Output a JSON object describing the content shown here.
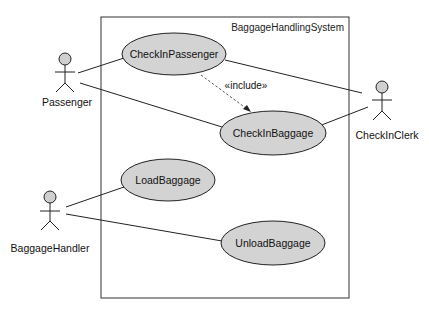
{
  "diagram": {
    "type": "uml-use-case",
    "system": {
      "label": "BaggageHandlingSystem"
    },
    "actors": [
      {
        "id": "passenger",
        "label": "Passenger"
      },
      {
        "id": "checkinclerk",
        "label": "CheckInClerk"
      },
      {
        "id": "baggagehandler",
        "label": "BaggageHandler"
      }
    ],
    "use_cases": [
      {
        "id": "checkinpassenger",
        "label": "CheckInPassenger"
      },
      {
        "id": "checkinbaggage",
        "label": "CheckInBaggage"
      },
      {
        "id": "loadbaggage",
        "label": "LoadBaggage"
      },
      {
        "id": "unloadbaggage",
        "label": "UnloadBaggage"
      }
    ],
    "relationships": [
      {
        "from": "Passenger",
        "to": "CheckInPassenger",
        "type": "association"
      },
      {
        "from": "Passenger",
        "to": "CheckInBaggage",
        "type": "association"
      },
      {
        "from": "CheckInClerk",
        "to": "CheckInPassenger",
        "type": "association"
      },
      {
        "from": "CheckInClerk",
        "to": "CheckInBaggage",
        "type": "association"
      },
      {
        "from": "BaggageHandler",
        "to": "LoadBaggage",
        "type": "association"
      },
      {
        "from": "BaggageHandler",
        "to": "UnloadBaggage",
        "type": "association"
      },
      {
        "from": "CheckInPassenger",
        "to": "CheckInBaggage",
        "type": "include",
        "label": "«include»"
      }
    ],
    "colors": {
      "use_case_fill": "#d3d3d3",
      "actor_head_fill": "#cfcfcf",
      "stroke": "#222222"
    }
  }
}
